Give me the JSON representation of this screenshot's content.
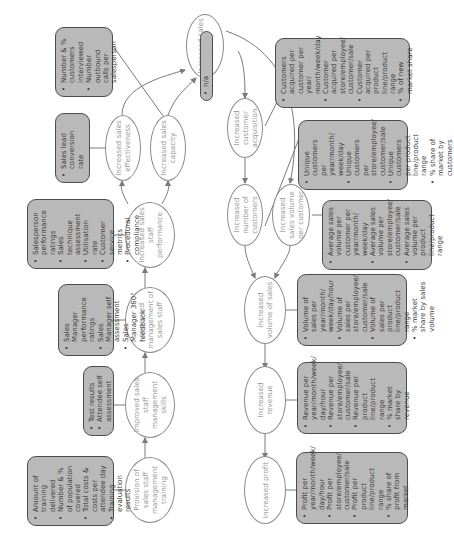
{
  "diagram": {
    "orientation": "rotated 90 degrees counter-clockwise",
    "nodes": {
      "provision": {
        "label": "Provision of sales staff management training"
      },
      "skills": {
        "label": "Improved sales staff management skills"
      },
      "management": {
        "label": "Improved management of sales staff"
      },
      "performance": {
        "label": "Increased sales staff performance"
      },
      "effectiveness": {
        "label": "Increased sales effectiveness"
      },
      "capacity": {
        "label": "Increased sales capacity"
      },
      "impact": {
        "label": "Increased sales impact"
      },
      "acquisition": {
        "label": "Increased customer acquisition"
      },
      "num_customers": {
        "label": "Increased number of customers"
      },
      "volume_per_customer": {
        "label": "Increased sales volume per customer"
      },
      "volume_sales": {
        "label": "Increased volume of sales"
      },
      "revenue": {
        "label": "Increased revenue"
      },
      "profit": {
        "label": "Increased profit"
      }
    },
    "measures": {
      "provision": [
        "Amount of training delivered",
        "Number & % of population covered",
        "Total costs & costs per attendee day",
        "Training evaluation results"
      ],
      "skills": [
        "Test results",
        "Attendee self assessment"
      ],
      "management": [
        "Sales Manager performance ratings",
        "Sales Manager self assessment",
        "Sales Manager 360° feedback"
      ],
      "performance": [
        "Salesperson performance ratings",
        "Sales technique assessment",
        "Utilisation rate",
        "Customer service metrics",
        "Procedural compliance"
      ],
      "effectiveness": [
        "Sales lead conversion rate"
      ],
      "capacity": [
        "Number & % customers interviewed",
        "Number outbound calls per salesperson"
      ],
      "impact": [
        "n/a"
      ],
      "acquisition": [
        "Customers acquired per customer per year/ month/week/day",
        "Customer acquired per store/employee/ customer/sale",
        "Customer acquired per product line/product range",
        "% of new market share"
      ],
      "num_customers": [
        "Unique customers per year/month/ week/day",
        "Unique customers per store/employee/ customer/sale",
        "Unique customers per product line/product range",
        "% share of market by customers"
      ],
      "volume_per_customer": [
        "Average sales volume per customer per year/month/ week/day",
        "Average sales volume per store/employee/ customer/sale",
        "Average sales volume per product line/product range"
      ],
      "volume_sales": [
        "Volume of sales per year/month/ week/day/hour",
        "Volume of sales per store/employee/ customer/sale",
        "Volume of sales per product line/product range",
        "% market share by sales volume"
      ],
      "revenue": [
        "Revenue per year/month/week/ day/hour",
        "Revenue per store/employee/ customer/sale",
        "Revenue per product line/product range",
        "% market share by revenue"
      ],
      "profit": [
        "Profit per year/month/week/ day/hour",
        "Profit per store/employee/ customer/sale",
        "Profit per product line/product range",
        "% share of profit from market"
      ]
    },
    "colors": {
      "box_fill": "#b9b9b9",
      "box_border": "#4d4d4d",
      "oval_border": "#8a8a8a",
      "oval_text": "#9a9a9a",
      "line": "#7a7a7a"
    }
  }
}
